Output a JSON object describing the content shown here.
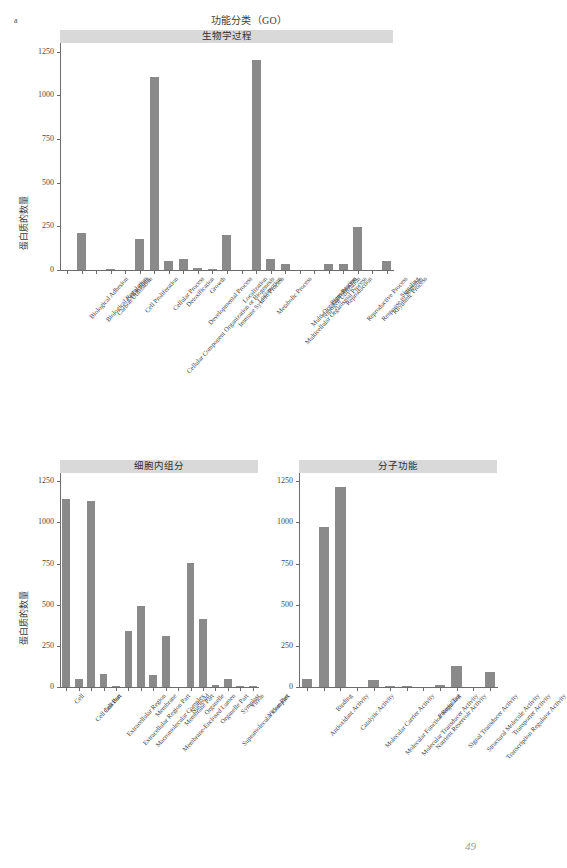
{
  "figure": {
    "panel_letter": "a",
    "title": "功能分类（GO）",
    "y_axis_title": "蛋白质的数量",
    "page_number": "49",
    "bar_color": "#8a8a8a",
    "strip_color": "#d9d9d9"
  },
  "chart_data": [
    {
      "type": "bar",
      "title": "生物学过程",
      "xlabel": "",
      "ylabel": "蛋白质的数量",
      "ylim": [
        0,
        1300
      ],
      "yticks": [
        0,
        250,
        500,
        750,
        1000,
        1250
      ],
      "grid": false,
      "legend": "none",
      "categories": [
        "Biological Adhesion",
        "Biological Regulation",
        "Carbon Utilization",
        "Cell Killing",
        "Cell Proliferation",
        "Cellular Component Organization or Biogenesis",
        "Cellular Process",
        "Detoxification",
        "Developmental Process",
        "Growth",
        "Immune System Process",
        "Localization",
        "Locomotion",
        "Metabolic Process",
        "Multicellular Organismal Process",
        "Multi-Organism Process",
        "Nitrogen Utilization",
        "Pigmentation",
        "Reproduction",
        "Reproductive Process",
        "Response to Stimulus",
        "Rhythmic Process",
        "Signaling"
      ],
      "values": [
        0,
        212,
        0,
        3,
        0,
        180,
        1105,
        50,
        65,
        13,
        8,
        200,
        0,
        1200,
        62,
        33,
        0,
        0,
        33,
        33,
        246,
        0,
        50
      ]
    },
    {
      "type": "bar",
      "title": "细胞内组分",
      "xlabel": "",
      "ylabel": "蛋白质的数量",
      "ylim": [
        0,
        1300
      ],
      "yticks": [
        0,
        250,
        500,
        750,
        1000,
        1250
      ],
      "grid": false,
      "legend": "none",
      "categories": [
        "Cell",
        "Cell Junction",
        "Cell Part",
        "Extracellular Region",
        "Extracellular Region Part",
        "Macromolecular Complex",
        "Membrane",
        "Membrane-Enclosed Lumen",
        "Membrane Part",
        "Nucleoid",
        "Organelle",
        "Organelle Part",
        "Supramolecular Complex",
        "Symplast",
        "Virion",
        "Virion Part"
      ],
      "values": [
        1140,
        50,
        1128,
        80,
        5,
        338,
        492,
        70,
        310,
        0,
        755,
        415,
        10,
        50,
        5,
        5
      ]
    },
    {
      "type": "bar",
      "title": "分子功能",
      "xlabel": "",
      "ylabel": "蛋白质的数量",
      "ylim": [
        0,
        1300
      ],
      "yticks": [
        0,
        250,
        500,
        750,
        1000,
        1250
      ],
      "grid": false,
      "legend": "none",
      "categories": [
        "Antioxidant Activity",
        "Binding",
        "Catalytic Activity",
        "Molecular Carrier Activity",
        "Molecular Function Regulator",
        "Molecular Transducer Activity",
        "Nutrient Reservoir Activity",
        "Protein Tag",
        "Signal Transducer Activity",
        "Structural Molecule Activity",
        "Transcription Regulator Activity",
        "Transporter Activity"
      ],
      "values": [
        48,
        975,
        1212,
        0,
        45,
        8,
        3,
        0,
        12,
        128,
        0,
        93
      ]
    }
  ]
}
